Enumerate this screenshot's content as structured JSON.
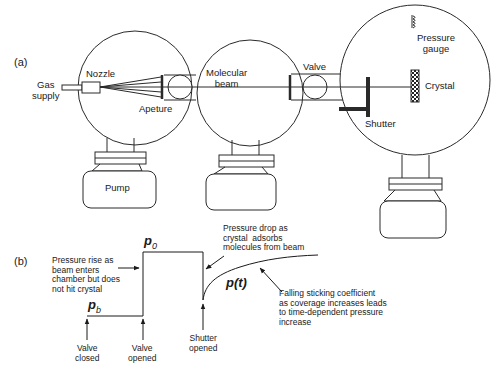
{
  "panel_a": {
    "label": "(a)",
    "gas_supply": "Gas\nsupply",
    "nozzle": "Nozzle",
    "aperture": "Apeture",
    "molecular_beam": "Molecular\nbeam",
    "valve": "Valve",
    "pressure_gauge": "Pressure\ngauge",
    "crystal": "Crystal",
    "shutter": "Shutter",
    "pump": "Pump"
  },
  "panel_b": {
    "label": "(b)",
    "p0": "p",
    "p0_sub": "0",
    "pb": "p",
    "pb_sub": "b",
    "pt": "p(t)",
    "rise_note": "Pressure rise as\nbeam enters\nchamber but does\nnot hit crystal",
    "drop_note": "Pressure drop as\ncrystal  adsorbs\nmolecules from beam",
    "falling_note": "Falling sticking coefficient\nas coverage increases leads\nto time-dependent pressure\nincrease",
    "valve_closed": "Valve\nclosed",
    "valve_opened": "Valve\nopened",
    "shutter_opened": "Shutter\nopened"
  },
  "colors": {
    "line": "#2a2a2a",
    "background": "#ffffff"
  }
}
